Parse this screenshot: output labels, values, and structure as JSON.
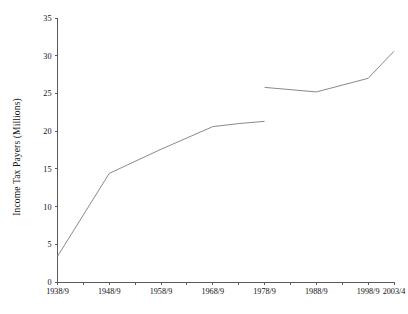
{
  "chart_data": {
    "type": "line",
    "title": "",
    "xlabel": "",
    "ylabel": "Income Tax Payers (Millions)",
    "ylim": [
      0,
      35
    ],
    "ytick_step": 5,
    "yticks": [
      "0",
      "5",
      "10",
      "15",
      "20",
      "25",
      "30",
      "35"
    ],
    "grid": false,
    "legend": "none",
    "x_minor_tick_interval_years": 5,
    "x_major_tick_labels": [
      "1938/9",
      "1948/9",
      "1958/9",
      "1968/9",
      "1978/9",
      "1988/9",
      "1998/9",
      "2003/4"
    ],
    "x_major_tick_years": [
      1938,
      1948,
      1958,
      1968,
      1978,
      1988,
      1998,
      2003
    ],
    "xlim_years": [
      1938,
      2003
    ],
    "series": [
      {
        "name": "Income tax payers (pre-independent taxation basis)",
        "x": [
          1938,
          1948,
          1958,
          1968,
          1973,
          1978
        ],
        "x_labels": [
          "1938/9",
          "1948/9",
          "1958/9",
          "1968/9",
          "1973/4",
          "1978/9"
        ],
        "values": [
          3.4,
          14.4,
          17.6,
          20.6,
          21.0,
          21.3
        ]
      },
      {
        "name": "Income tax payers (later basis)",
        "x": [
          1978,
          1988,
          1998,
          2003
        ],
        "x_labels": [
          "1978/9",
          "1988/9",
          "1998/9",
          "2003/4"
        ],
        "values": [
          25.8,
          25.2,
          27.0,
          30.6
        ]
      }
    ],
    "colors": {
      "line": "#8a8a8a",
      "axis": "#5a5a5a",
      "text": "#111111",
      "background": "#ffffff"
    }
  }
}
